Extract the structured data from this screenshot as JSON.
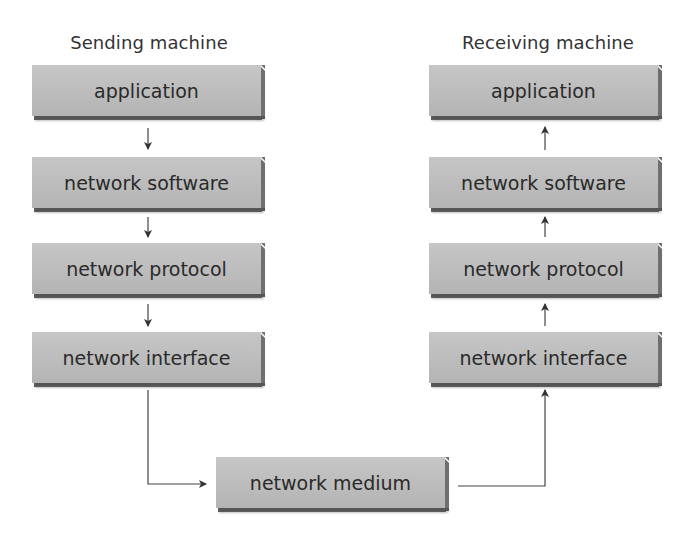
{
  "diagram": {
    "sending": {
      "title": "Sending machine",
      "layers": [
        "application",
        "network software",
        "network protocol",
        "network interface"
      ]
    },
    "receiving": {
      "title": "Receiving machine",
      "layers": [
        "application",
        "network software",
        "network protocol",
        "network interface"
      ]
    },
    "medium": {
      "label": "network medium"
    },
    "colors": {
      "box_fill": "#bdbdbd",
      "box_edge": "#5c5c5c",
      "text": "#2a2a2a",
      "line": "#333333"
    }
  }
}
